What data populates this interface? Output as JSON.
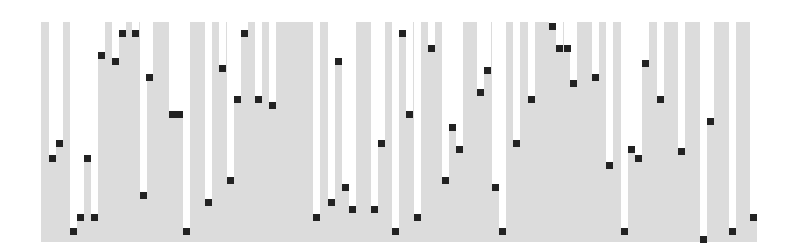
{
  "chart_data": {
    "type": "scatter",
    "title": "",
    "xlabel": "",
    "ylabel": "",
    "grid": false,
    "legend": null,
    "ylim": [
      0,
      100
    ],
    "style": {
      "band_color": "#dcdcdc",
      "marker_color": "#222222",
      "background": "#ffffff"
    },
    "plot_area_px": {
      "left": 41,
      "top": 22,
      "right": 757,
      "bottom": 242
    },
    "points": [
      {
        "x": 52,
        "y": 38
      },
      {
        "x": 59,
        "y": 45
      },
      {
        "x": 73,
        "y": 5
      },
      {
        "x": 80,
        "y": 11
      },
      {
        "x": 87,
        "y": 38
      },
      {
        "x": 94,
        "y": 11
      },
      {
        "x": 101,
        "y": 85
      },
      {
        "x": 115,
        "y": 82
      },
      {
        "x": 122,
        "y": 95
      },
      {
        "x": 135,
        "y": 95
      },
      {
        "x": 143,
        "y": 21
      },
      {
        "x": 149,
        "y": 75
      },
      {
        "x": 172,
        "y": 58
      },
      {
        "x": 179,
        "y": 58
      },
      {
        "x": 186,
        "y": 5
      },
      {
        "x": 208,
        "y": 18
      },
      {
        "x": 222,
        "y": 79
      },
      {
        "x": 230,
        "y": 28
      },
      {
        "x": 237,
        "y": 65
      },
      {
        "x": 244,
        "y": 95
      },
      {
        "x": 258,
        "y": 65
      },
      {
        "x": 272,
        "y": 62
      },
      {
        "x": 316,
        "y": 11
      },
      {
        "x": 331,
        "y": 18
      },
      {
        "x": 338,
        "y": 82
      },
      {
        "x": 345,
        "y": 25
      },
      {
        "x": 352,
        "y": 15
      },
      {
        "x": 374,
        "y": 15
      },
      {
        "x": 381,
        "y": 45
      },
      {
        "x": 395,
        "y": 5
      },
      {
        "x": 402,
        "y": 95
      },
      {
        "x": 409,
        "y": 58
      },
      {
        "x": 417,
        "y": 11
      },
      {
        "x": 431,
        "y": 88
      },
      {
        "x": 445,
        "y": 28
      },
      {
        "x": 452,
        "y": 52
      },
      {
        "x": 459,
        "y": 42
      },
      {
        "x": 480,
        "y": 68
      },
      {
        "x": 487,
        "y": 78
      },
      {
        "x": 495,
        "y": 25
      },
      {
        "x": 502,
        "y": 5
      },
      {
        "x": 516,
        "y": 45
      },
      {
        "x": 531,
        "y": 65
      },
      {
        "x": 552,
        "y": 98
      },
      {
        "x": 559,
        "y": 88
      },
      {
        "x": 567,
        "y": 88
      },
      {
        "x": 573,
        "y": 72
      },
      {
        "x": 595,
        "y": 75
      },
      {
        "x": 609,
        "y": 35
      },
      {
        "x": 624,
        "y": 5
      },
      {
        "x": 631,
        "y": 42
      },
      {
        "x": 638,
        "y": 38
      },
      {
        "x": 645,
        "y": 81
      },
      {
        "x": 660,
        "y": 65
      },
      {
        "x": 681,
        "y": 41
      },
      {
        "x": 703,
        "y": 1
      },
      {
        "x": 710,
        "y": 55
      },
      {
        "x": 732,
        "y": 5
      },
      {
        "x": 753,
        "y": 11
      }
    ]
  }
}
